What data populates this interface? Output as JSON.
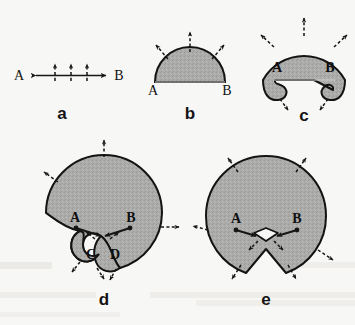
{
  "figure": {
    "kind": "scientific-diagram",
    "background_color": "#f7f7f6",
    "fill_color": "#a9a9a7",
    "outline_color": "#131313",
    "arrow_color": "#161616",
    "panels": [
      {
        "id": "a",
        "letter": "a",
        "left_point": "A",
        "right_point": "B",
        "normal_ticks": 3,
        "caption_note": "initial straight segment A to B with three outward normals"
      },
      {
        "id": "b",
        "letter": "b",
        "left_point": "A",
        "right_point": "B",
        "arrows": 3,
        "caption_note": "semicircular wavefront expanded from segment"
      },
      {
        "id": "c",
        "letter": "c",
        "left_point": "A",
        "right_point": "B",
        "arrows": 5,
        "caption_note": "wavefront wraps past endpoints forming spirals at A and B"
      },
      {
        "id": "d",
        "letter": "d",
        "left_point": "A",
        "right_point": "B",
        "inner_left_point": "C",
        "inner_right_point": "D",
        "arrows": 8,
        "caption_note": "fronts from A and B meet, creating inner loops C and D"
      },
      {
        "id": "e",
        "letter": "e",
        "left_point": "A",
        "right_point": "B",
        "arrows": 8,
        "caption_note": "loops shrink to a small swallowtail; nearly circular front"
      }
    ]
  }
}
